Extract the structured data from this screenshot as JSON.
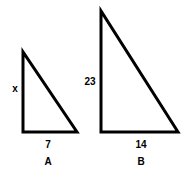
{
  "figure": {
    "background_color": "#ffffff",
    "stroke_color": "#000000",
    "stroke_width": 3,
    "shapes": [
      {
        "name": "A",
        "type": "right-triangle",
        "points": "23,52 23,132 77,132",
        "vertical_leg_label": "x",
        "base_label": "7",
        "shape_name_label": "A"
      },
      {
        "name": "B",
        "type": "right-triangle",
        "points": "101,11 101,132 178,132",
        "vertical_leg_label": "23",
        "base_label": "14",
        "shape_name_label": "B"
      }
    ]
  },
  "chart_data": {
    "type": "diagram",
    "title": "",
    "shapes": [
      {
        "label": "A",
        "vertical_leg": "x",
        "base": "7"
      },
      {
        "label": "B",
        "vertical_leg": "23",
        "base": "14"
      }
    ]
  }
}
